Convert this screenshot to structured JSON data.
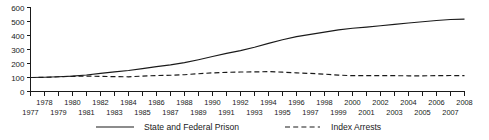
{
  "chart_data": {
    "type": "line",
    "title": "",
    "subtitle": "",
    "xlabel": "",
    "ylabel": "",
    "ylim": [
      0,
      600
    ],
    "xlim": [
      1977,
      2008
    ],
    "grid": false,
    "legend_position": "bottom",
    "yticks": [
      0,
      100,
      200,
      300,
      400,
      500,
      600
    ],
    "ytick_labels": [
      "0",
      "100",
      "200",
      "300",
      "400",
      "500",
      "600"
    ],
    "x": [
      1977,
      1978,
      1979,
      1980,
      1981,
      1982,
      1983,
      1984,
      1985,
      1986,
      1987,
      1988,
      1989,
      1990,
      1991,
      1992,
      1993,
      1994,
      1995,
      1996,
      1997,
      1998,
      1999,
      2000,
      2001,
      2002,
      2003,
      2004,
      2005,
      2006,
      2007,
      2008
    ],
    "xtick_labels_top": [
      "1978",
      "1980",
      "1982",
      "1984",
      "1986",
      "1988",
      "1990",
      "1992",
      "1994",
      "1996",
      "1998",
      "2000",
      "2002",
      "2004",
      "2006",
      "2008"
    ],
    "xtick_labels_bottom": [
      "1977",
      "1979",
      "1981",
      "1983",
      "1985",
      "1987",
      "1989",
      "1991",
      "1993",
      "1995",
      "1997",
      "1999",
      "2001",
      "2003",
      "2005",
      "2007"
    ],
    "series": [
      {
        "name": "State and Federal Prison",
        "style": "solid",
        "color": "#1a1a1a",
        "values": [
          100,
          102,
          105,
          110,
          118,
          129,
          140,
          150,
          163,
          178,
          190,
          206,
          227,
          250,
          272,
          292,
          316,
          344,
          370,
          392,
          408,
          424,
          440,
          452,
          460,
          470,
          479,
          489,
          498,
          507,
          514,
          517
        ]
      },
      {
        "name": "Index Arrests",
        "style": "dashed",
        "color": "#1a1a1a",
        "values": [
          100,
          101,
          105,
          108,
          110,
          108,
          106,
          105,
          110,
          114,
          116,
          120,
          127,
          133,
          137,
          139,
          140,
          142,
          138,
          133,
          129,
          124,
          117,
          113,
          113,
          114,
          113,
          112,
          112,
          113,
          114,
          113
        ]
      }
    ],
    "legend": [
      {
        "label": "State and Federal Prison",
        "style": "solid"
      },
      {
        "label": "Index Arrests",
        "style": "dashed"
      }
    ]
  }
}
